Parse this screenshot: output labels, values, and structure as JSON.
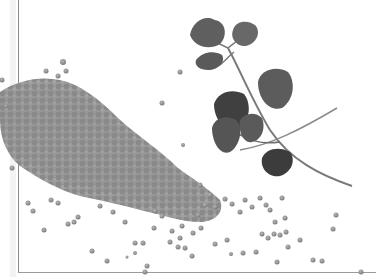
{
  "image": {
    "description": "Grayscale photo of a pile of split red lentils scattered across a white surface with a sprig of fresh cilantro (coriander) on the upper right",
    "subjects": [
      "lentils",
      "cilantro-sprig"
    ],
    "colors": {
      "background": "#ffffff",
      "lentil": "#8f8f8f",
      "lentil_dark": "#6e6e6e",
      "leaf": "#5a5a5a",
      "leaf_dark": "#3f3f3f",
      "stem": "#7a7a7a",
      "axis": "#8a8a8a"
    }
  }
}
